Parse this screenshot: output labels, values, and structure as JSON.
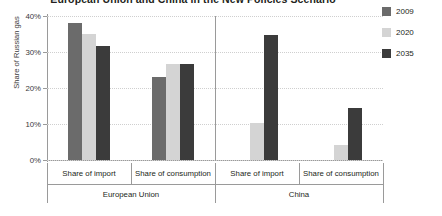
{
  "chart_data": {
    "type": "bar",
    "title": "European Union and China in the New Policies Scenario",
    "xlabel": "",
    "ylabel": "Share of Russian gas",
    "ylim": [
      0,
      40
    ],
    "ytick_labels": [
      "0%",
      "10%",
      "20%",
      "30%",
      "40%"
    ],
    "ytick_values": [
      0,
      10,
      20,
      30,
      40
    ],
    "grid": true,
    "legend_position": "right",
    "groups": [
      {
        "name": "European Union",
        "categories": [
          "Share of import",
          "Share of consumption"
        ]
      },
      {
        "name": "China",
        "categories": [
          "Share of import",
          "Share of consumption"
        ]
      }
    ],
    "categories": [
      "European Union / Share of import",
      "European Union / Share of consumption",
      "China / Share of import",
      "China / Share of consumption"
    ],
    "series": [
      {
        "name": "2009",
        "color": "#6b6b6b",
        "values": [
          38.0,
          23.0,
          0.0,
          0.0
        ]
      },
      {
        "name": "2020",
        "color": "#d4d4d4",
        "values": [
          35.0,
          26.6,
          10.2,
          4.3
        ]
      },
      {
        "name": "2035",
        "color": "#3b3b3b",
        "values": [
          31.8,
          26.8,
          34.7,
          14.5
        ]
      }
    ]
  },
  "legend": {
    "items": [
      {
        "label": "2009",
        "color": "#6b6b6b"
      },
      {
        "label": "2020",
        "color": "#d4d4d4"
      },
      {
        "label": "2035",
        "color": "#3b3b3b"
      }
    ]
  }
}
